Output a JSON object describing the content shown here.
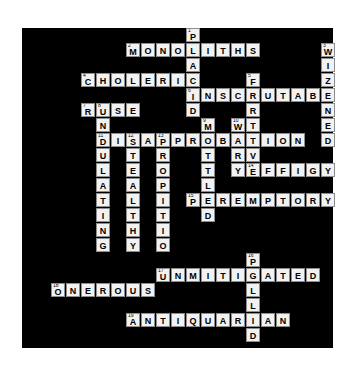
{
  "puzzle": {
    "title": "Crossword Puzzle",
    "background_color": "#000000",
    "page_background_color": "#ffffff",
    "cell_fill_color": "#f2f2f2",
    "cell_border_color": "#8d8d8d",
    "letter_color": "#000000",
    "columns": 20,
    "rows": 21,
    "cell_size": 15,
    "grid_origin": {
      "x": 36,
      "y": 28
    },
    "entries": [
      {
        "number": "1",
        "direction": "down",
        "answer": "PLACID",
        "row": 0,
        "col": 10
      },
      {
        "number": "2",
        "direction": "across",
        "answer": "MONOLITHS",
        "row": 1,
        "col": 6
      },
      {
        "number": "3",
        "direction": "down",
        "answer": "WIZENED",
        "row": 1,
        "col": 19
      },
      {
        "number": "4",
        "direction": "across",
        "answer": "CHOLERIC",
        "row": 3,
        "col": 3
      },
      {
        "number": "5",
        "direction": "down",
        "answer": "FRTIVE",
        "row": 3,
        "col": 14
      },
      {
        "number": "6",
        "direction": "across",
        "answer": "INSCRUTABLE",
        "row": 4,
        "col": 10
      },
      {
        "number": "7",
        "direction": "across",
        "answer": "RUSE",
        "row": 5,
        "col": 3
      },
      {
        "number": "8",
        "direction": "down",
        "answer": "UNDULATING",
        "row": 5,
        "col": 4
      },
      {
        "number": "9",
        "direction": "down",
        "answer": "MOTTLED",
        "row": 6,
        "col": 11
      },
      {
        "number": "10",
        "direction": "down",
        "answer": "WARY",
        "row": 6,
        "col": 13
      },
      {
        "number": "11",
        "direction": "across",
        "answer": "DISAPPROBATION",
        "row": 7,
        "col": 4
      },
      {
        "number": "12",
        "direction": "down",
        "answer": "STEALTHY",
        "row": 7,
        "col": 6
      },
      {
        "number": "13",
        "direction": "down",
        "answer": "PROPITIOUS",
        "row": 7,
        "col": 8
      },
      {
        "number": "14",
        "direction": "across",
        "answer": "EFFIGY",
        "row": 9,
        "col": 14
      },
      {
        "number": "15",
        "direction": "across",
        "answer": "PEREMPTORY",
        "row": 11,
        "col": 10
      },
      {
        "number": "16",
        "direction": "down",
        "answer": "PALLID",
        "row": 15,
        "col": 14
      },
      {
        "number": "17",
        "direction": "across",
        "answer": "UNMITIGATED",
        "row": 16,
        "col": 8
      },
      {
        "number": "18",
        "direction": "across",
        "answer": "ONEROUS",
        "row": 17,
        "col": 1
      },
      {
        "number": "19",
        "direction": "across",
        "answer": "ANTIQUARIAN",
        "row": 19,
        "col": 6
      }
    ],
    "cells": [
      {
        "r": 0,
        "c": 10,
        "l": "P",
        "n": "1"
      },
      {
        "r": 1,
        "c": 6,
        "l": "M",
        "n": "2"
      },
      {
        "r": 1,
        "c": 7,
        "l": "O",
        "n": ""
      },
      {
        "r": 1,
        "c": 8,
        "l": "N",
        "n": ""
      },
      {
        "r": 1,
        "c": 9,
        "l": "O",
        "n": ""
      },
      {
        "r": 1,
        "c": 10,
        "l": "L",
        "n": ""
      },
      {
        "r": 1,
        "c": 11,
        "l": "I",
        "n": ""
      },
      {
        "r": 1,
        "c": 12,
        "l": "T",
        "n": ""
      },
      {
        "r": 1,
        "c": 13,
        "l": "H",
        "n": ""
      },
      {
        "r": 1,
        "c": 14,
        "l": "S",
        "n": ""
      },
      {
        "r": 1,
        "c": 19,
        "l": "W",
        "n": "3"
      },
      {
        "r": 2,
        "c": 10,
        "l": "A",
        "n": ""
      },
      {
        "r": 2,
        "c": 19,
        "l": "I",
        "n": ""
      },
      {
        "r": 3,
        "c": 3,
        "l": "C",
        "n": "4"
      },
      {
        "r": 3,
        "c": 4,
        "l": "H",
        "n": ""
      },
      {
        "r": 3,
        "c": 5,
        "l": "O",
        "n": ""
      },
      {
        "r": 3,
        "c": 6,
        "l": "L",
        "n": ""
      },
      {
        "r": 3,
        "c": 7,
        "l": "E",
        "n": ""
      },
      {
        "r": 3,
        "c": 8,
        "l": "R",
        "n": ""
      },
      {
        "r": 3,
        "c": 9,
        "l": "I",
        "n": ""
      },
      {
        "r": 3,
        "c": 10,
        "l": "C",
        "n": ""
      },
      {
        "r": 3,
        "c": 14,
        "l": "F",
        "n": "5"
      },
      {
        "r": 3,
        "c": 19,
        "l": "Z",
        "n": ""
      },
      {
        "r": 4,
        "c": 10,
        "l": "I",
        "n": "6"
      },
      {
        "r": 4,
        "c": 11,
        "l": "N",
        "n": ""
      },
      {
        "r": 4,
        "c": 12,
        "l": "S",
        "n": ""
      },
      {
        "r": 4,
        "c": 13,
        "l": "C",
        "n": ""
      },
      {
        "r": 4,
        "c": 14,
        "l": "R",
        "n": ""
      },
      {
        "r": 4,
        "c": 15,
        "l": "U",
        "n": ""
      },
      {
        "r": 4,
        "c": 16,
        "l": "T",
        "n": ""
      },
      {
        "r": 4,
        "c": 17,
        "l": "A",
        "n": ""
      },
      {
        "r": 4,
        "c": 18,
        "l": "B",
        "n": ""
      },
      {
        "r": 4,
        "c": 19,
        "l": "E",
        "n": ""
      },
      {
        "r": 5,
        "c": 3,
        "l": "R",
        "n": "7"
      },
      {
        "r": 5,
        "c": 4,
        "l": "U",
        "n": "8"
      },
      {
        "r": 5,
        "c": 5,
        "l": "S",
        "n": ""
      },
      {
        "r": 5,
        "c": 6,
        "l": "E",
        "n": ""
      },
      {
        "r": 5,
        "c": 10,
        "l": "D",
        "n": ""
      },
      {
        "r": 5,
        "c": 14,
        "l": "R",
        "n": ""
      },
      {
        "r": 5,
        "c": 19,
        "l": "N",
        "n": ""
      },
      {
        "r": 6,
        "c": 4,
        "l": "N",
        "n": ""
      },
      {
        "r": 6,
        "c": 11,
        "l": "M",
        "n": "9"
      },
      {
        "r": 6,
        "c": 13,
        "l": "W",
        "n": "10"
      },
      {
        "r": 6,
        "c": 14,
        "l": "T",
        "n": ""
      },
      {
        "r": 6,
        "c": 19,
        "l": "E",
        "n": ""
      },
      {
        "r": 7,
        "c": 4,
        "l": "D",
        "n": "11"
      },
      {
        "r": 7,
        "c": 5,
        "l": "I",
        "n": ""
      },
      {
        "r": 7,
        "c": 6,
        "l": "S",
        "n": "12"
      },
      {
        "r": 7,
        "c": 7,
        "l": "A",
        "n": ""
      },
      {
        "r": 7,
        "c": 8,
        "l": "P",
        "n": "13"
      },
      {
        "r": 7,
        "c": 9,
        "l": "P",
        "n": ""
      },
      {
        "r": 7,
        "c": 10,
        "l": "R",
        "n": ""
      },
      {
        "r": 7,
        "c": 11,
        "l": "O",
        "n": ""
      },
      {
        "r": 7,
        "c": 12,
        "l": "B",
        "n": ""
      },
      {
        "r": 7,
        "c": 13,
        "l": "A",
        "n": ""
      },
      {
        "r": 7,
        "c": 14,
        "l": "T",
        "n": ""
      },
      {
        "r": 7,
        "c": 15,
        "l": "I",
        "n": ""
      },
      {
        "r": 7,
        "c": 16,
        "l": "O",
        "n": ""
      },
      {
        "r": 7,
        "c": 17,
        "l": "N",
        "n": ""
      },
      {
        "r": 7,
        "c": 19,
        "l": "D",
        "n": ""
      },
      {
        "r": 8,
        "c": 4,
        "l": "U",
        "n": ""
      },
      {
        "r": 8,
        "c": 6,
        "l": "T",
        "n": ""
      },
      {
        "r": 8,
        "c": 8,
        "l": "R",
        "n": ""
      },
      {
        "r": 8,
        "c": 11,
        "l": "T",
        "n": ""
      },
      {
        "r": 8,
        "c": 13,
        "l": "R",
        "n": ""
      },
      {
        "r": 8,
        "c": 14,
        "l": "V",
        "n": ""
      },
      {
        "r": 9,
        "c": 4,
        "l": "L",
        "n": ""
      },
      {
        "r": 9,
        "c": 6,
        "l": "E",
        "n": ""
      },
      {
        "r": 9,
        "c": 8,
        "l": "O",
        "n": ""
      },
      {
        "r": 9,
        "c": 11,
        "l": "T",
        "n": ""
      },
      {
        "r": 9,
        "c": 13,
        "l": "Y",
        "n": ""
      },
      {
        "r": 9,
        "c": 14,
        "l": "E",
        "n": "14"
      },
      {
        "r": 9,
        "c": 15,
        "l": "F",
        "n": ""
      },
      {
        "r": 9,
        "c": 16,
        "l": "F",
        "n": ""
      },
      {
        "r": 9,
        "c": 17,
        "l": "I",
        "n": ""
      },
      {
        "r": 9,
        "c": 18,
        "l": "G",
        "n": ""
      },
      {
        "r": 9,
        "c": 19,
        "l": "Y",
        "n": ""
      },
      {
        "r": 10,
        "c": 4,
        "l": "A",
        "n": ""
      },
      {
        "r": 10,
        "c": 6,
        "l": "A",
        "n": ""
      },
      {
        "r": 10,
        "c": 8,
        "l": "P",
        "n": ""
      },
      {
        "r": 10,
        "c": 11,
        "l": "L",
        "n": ""
      },
      {
        "r": 11,
        "c": 4,
        "l": "T",
        "n": ""
      },
      {
        "r": 11,
        "c": 6,
        "l": "L",
        "n": ""
      },
      {
        "r": 11,
        "c": 8,
        "l": "I",
        "n": ""
      },
      {
        "r": 11,
        "c": 10,
        "l": "P",
        "n": "15"
      },
      {
        "r": 11,
        "c": 11,
        "l": "E",
        "n": ""
      },
      {
        "r": 11,
        "c": 12,
        "l": "R",
        "n": ""
      },
      {
        "r": 11,
        "c": 13,
        "l": "E",
        "n": ""
      },
      {
        "r": 11,
        "c": 14,
        "l": "M",
        "n": ""
      },
      {
        "r": 11,
        "c": 15,
        "l": "P",
        "n": ""
      },
      {
        "r": 11,
        "c": 16,
        "l": "T",
        "n": ""
      },
      {
        "r": 11,
        "c": 17,
        "l": "O",
        "n": ""
      },
      {
        "r": 11,
        "c": 18,
        "l": "R",
        "n": ""
      },
      {
        "r": 11,
        "c": 19,
        "l": "Y",
        "n": ""
      },
      {
        "r": 12,
        "c": 4,
        "l": "I",
        "n": ""
      },
      {
        "r": 12,
        "c": 6,
        "l": "T",
        "n": ""
      },
      {
        "r": 12,
        "c": 8,
        "l": "T",
        "n": ""
      },
      {
        "r": 12,
        "c": 11,
        "l": "D",
        "n": ""
      },
      {
        "r": 13,
        "c": 4,
        "l": "N",
        "n": ""
      },
      {
        "r": 13,
        "c": 6,
        "l": "H",
        "n": ""
      },
      {
        "r": 13,
        "c": 8,
        "l": "I",
        "n": ""
      },
      {
        "r": 14,
        "c": 4,
        "l": "G",
        "n": ""
      },
      {
        "r": 14,
        "c": 6,
        "l": "Y",
        "n": ""
      },
      {
        "r": 14,
        "c": 8,
        "l": "O",
        "n": ""
      },
      {
        "r": 15,
        "c": 14,
        "l": "P",
        "n": "16"
      },
      {
        "r": 16,
        "c": 8,
        "l": "U",
        "n": "17"
      },
      {
        "r": 16,
        "c": 9,
        "l": "N",
        "n": ""
      },
      {
        "r": 16,
        "c": 10,
        "l": "M",
        "n": ""
      },
      {
        "r": 16,
        "c": 11,
        "l": "I",
        "n": ""
      },
      {
        "r": 16,
        "c": 12,
        "l": "T",
        "n": ""
      },
      {
        "r": 16,
        "c": 13,
        "l": "I",
        "n": ""
      },
      {
        "r": 16,
        "c": 14,
        "l": "G",
        "n": ""
      },
      {
        "r": 16,
        "c": 15,
        "l": "A",
        "n": ""
      },
      {
        "r": 16,
        "c": 16,
        "l": "T",
        "n": ""
      },
      {
        "r": 16,
        "c": 17,
        "l": "E",
        "n": ""
      },
      {
        "r": 16,
        "c": 18,
        "l": "D",
        "n": ""
      },
      {
        "r": 17,
        "c": 1,
        "l": "O",
        "n": "18"
      },
      {
        "r": 17,
        "c": 2,
        "l": "N",
        "n": ""
      },
      {
        "r": 17,
        "c": 3,
        "l": "E",
        "n": ""
      },
      {
        "r": 17,
        "c": 4,
        "l": "R",
        "n": ""
      },
      {
        "r": 17,
        "c": 5,
        "l": "O",
        "n": ""
      },
      {
        "r": 17,
        "c": 6,
        "l": "U",
        "n": ""
      },
      {
        "r": 17,
        "c": 7,
        "l": "S",
        "n": ""
      },
      {
        "r": 17,
        "c": 14,
        "l": "L",
        "n": ""
      },
      {
        "r": 18,
        "c": 14,
        "l": "L",
        "n": ""
      },
      {
        "r": 19,
        "c": 6,
        "l": "A",
        "n": "19"
      },
      {
        "r": 19,
        "c": 7,
        "l": "N",
        "n": ""
      },
      {
        "r": 19,
        "c": 8,
        "l": "T",
        "n": ""
      },
      {
        "r": 19,
        "c": 9,
        "l": "I",
        "n": ""
      },
      {
        "r": 19,
        "c": 10,
        "l": "Q",
        "n": ""
      },
      {
        "r": 19,
        "c": 11,
        "l": "U",
        "n": ""
      },
      {
        "r": 19,
        "c": 12,
        "l": "A",
        "n": ""
      },
      {
        "r": 19,
        "c": 13,
        "l": "R",
        "n": ""
      },
      {
        "r": 19,
        "c": 14,
        "l": "I",
        "n": ""
      },
      {
        "r": 19,
        "c": 15,
        "l": "A",
        "n": ""
      },
      {
        "r": 19,
        "c": 16,
        "l": "N",
        "n": ""
      },
      {
        "r": 20,
        "c": 14,
        "l": "D",
        "n": ""
      }
    ]
  }
}
